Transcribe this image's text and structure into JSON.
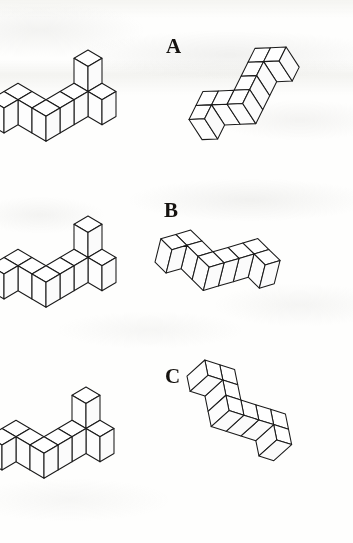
{
  "page": {
    "width": 353,
    "height": 543,
    "background_color": "#fefefd",
    "ink_color": "#1a1a1a",
    "face_color": "#ffffff"
  },
  "rows": [
    {
      "label": "A",
      "label_x": 166,
      "label_y": 36,
      "left_figure": {
        "name": "reference-figure-a",
        "origin_x": 88,
        "origin_y": 100,
        "unit": 25,
        "skew_x": 0.56,
        "skew_y": 0.33,
        "cubes": [
          [
            0,
            0,
            0
          ],
          [
            1,
            0,
            0
          ],
          [
            0,
            0,
            1
          ],
          [
            0,
            1,
            0
          ],
          [
            0,
            2,
            0
          ],
          [
            0,
            3,
            0
          ],
          [
            -1,
            3,
            0
          ],
          [
            -2,
            3,
            0
          ],
          [
            -2,
            4,
            0
          ]
        ]
      },
      "right_figure": {
        "name": "candidate-figure-a",
        "origin_x": 268,
        "origin_y": 68,
        "unit": 24,
        "rotation": -33,
        "cubes": [
          [
            0,
            0,
            0
          ],
          [
            1,
            0,
            0
          ],
          [
            0,
            1,
            0
          ],
          [
            0,
            2,
            0
          ],
          [
            0,
            3,
            0
          ],
          [
            -1,
            3,
            0
          ],
          [
            -2,
            3,
            0
          ],
          [
            -2,
            4,
            0
          ]
        ]
      }
    },
    {
      "label": "B",
      "label_x": 164,
      "label_y": 200,
      "left_figure": {
        "name": "reference-figure-b",
        "origin_x": 88,
        "origin_y": 266,
        "unit": 25,
        "skew_x": 0.56,
        "skew_y": 0.33,
        "cubes": [
          [
            0,
            0,
            0
          ],
          [
            1,
            0,
            0
          ],
          [
            0,
            0,
            1
          ],
          [
            0,
            1,
            0
          ],
          [
            0,
            2,
            0
          ],
          [
            0,
            3,
            0
          ],
          [
            -1,
            3,
            0
          ],
          [
            -2,
            3,
            0
          ],
          [
            -2,
            4,
            0
          ]
        ]
      },
      "right_figure": {
        "name": "candidate-figure-b",
        "origin_x": 252,
        "origin_y": 262,
        "unit": 24,
        "rotation": 14,
        "cubes": [
          [
            0,
            0,
            0
          ],
          [
            1,
            0,
            0
          ],
          [
            0,
            1,
            0
          ],
          [
            0,
            2,
            0
          ],
          [
            0,
            3,
            0
          ],
          [
            -1,
            3,
            0
          ],
          [
            -2,
            3,
            0
          ],
          [
            -2,
            4,
            0
          ]
        ]
      }
    },
    {
      "label": "C",
      "label_x": 165,
      "label_y": 366,
      "left_figure": {
        "name": "reference-figure-c",
        "origin_x": 86,
        "origin_y": 437,
        "unit": 25,
        "skew_x": 0.56,
        "skew_y": 0.33,
        "cubes": [
          [
            0,
            0,
            0
          ],
          [
            1,
            0,
            0
          ],
          [
            0,
            0,
            1
          ],
          [
            0,
            1,
            0
          ],
          [
            0,
            2,
            0
          ],
          [
            0,
            3,
            0
          ],
          [
            -1,
            3,
            0
          ],
          [
            -2,
            3,
            0
          ],
          [
            -2,
            4,
            0
          ]
        ]
      },
      "right_figure": {
        "name": "candidate-figure-c",
        "origin_x": 268,
        "origin_y": 430,
        "unit": 24,
        "rotation": 48,
        "cubes": [
          [
            0,
            0,
            0
          ],
          [
            1,
            0,
            0
          ],
          [
            0,
            1,
            0
          ],
          [
            0,
            2,
            0
          ],
          [
            0,
            3,
            0
          ],
          [
            -1,
            3,
            0
          ],
          [
            -2,
            3,
            0
          ],
          [
            -2,
            4,
            0
          ]
        ]
      }
    }
  ]
}
